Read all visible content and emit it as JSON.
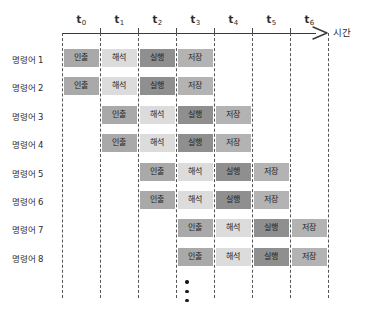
{
  "axis": {
    "label": "시간",
    "ticks": [
      {
        "id": "t0",
        "base": "t",
        "sub": "0"
      },
      {
        "id": "t1",
        "base": "t",
        "sub": "1"
      },
      {
        "id": "t2",
        "base": "t",
        "sub": "2"
      },
      {
        "id": "t3",
        "base": "t",
        "sub": "3"
      },
      {
        "id": "t4",
        "base": "t",
        "sub": "4"
      },
      {
        "id": "t5",
        "base": "t",
        "sub": "5"
      },
      {
        "id": "t6",
        "base": "t",
        "sub": "6"
      }
    ]
  },
  "stage_names": {
    "fetch": "인출",
    "decode": "해석",
    "execute": "실행",
    "store": "저장"
  },
  "stage_colors": {
    "fetch": "#a9a9a9",
    "decode": "#dcdcdc",
    "execute": "#8f8f8f",
    "store": "#b3b3b3"
  },
  "rows": [
    {
      "label": "명령어 1",
      "start_slot": 0
    },
    {
      "label": "명령어 2",
      "start_slot": 0
    },
    {
      "label": "명령어 3",
      "start_slot": 1
    },
    {
      "label": "명령어 4",
      "start_slot": 1
    },
    {
      "label": "명령어 5",
      "start_slot": 2
    },
    {
      "label": "명령어 6",
      "start_slot": 2
    },
    {
      "label": "명령어 7",
      "start_slot": 3
    },
    {
      "label": "명령어 8",
      "start_slot": 3
    }
  ],
  "stage_order": [
    "fetch",
    "decode",
    "execute",
    "store"
  ],
  "ellipsis_dots": 3,
  "chart_data": {
    "type": "table",
    "xlabel": "시간",
    "ylabel": "명령어",
    "categories": [
      "t0",
      "t1",
      "t2",
      "t3",
      "t4",
      "t5",
      "t6"
    ],
    "series": [
      {
        "name": "명령어 1",
        "values": [
          "인출",
          "해석",
          "실행",
          "저장",
          "",
          "",
          ""
        ]
      },
      {
        "name": "명령어 2",
        "values": [
          "인출",
          "해석",
          "실행",
          "저장",
          "",
          "",
          ""
        ]
      },
      {
        "name": "명령어 3",
        "values": [
          "",
          "인출",
          "해석",
          "실행",
          "저장",
          "",
          ""
        ]
      },
      {
        "name": "명령어 4",
        "values": [
          "",
          "인출",
          "해석",
          "실행",
          "저장",
          "",
          ""
        ]
      },
      {
        "name": "명령어 5",
        "values": [
          "",
          "",
          "인출",
          "해석",
          "실행",
          "저장",
          ""
        ]
      },
      {
        "name": "명령어 6",
        "values": [
          "",
          "",
          "인출",
          "해석",
          "실행",
          "저장",
          ""
        ]
      },
      {
        "name": "명령어 7",
        "values": [
          "",
          "",
          "",
          "인출",
          "해석",
          "실행",
          "저장"
        ]
      },
      {
        "name": "명령어 8",
        "values": [
          "",
          "",
          "",
          "인출",
          "해석",
          "실행",
          "저장"
        ]
      }
    ]
  }
}
